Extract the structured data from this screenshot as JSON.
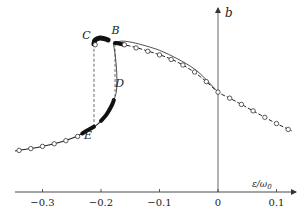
{
  "chart_data": {
    "type": "line",
    "title": "",
    "xlabel": "ε/ω₀",
    "xlabel_main": "ε/ω",
    "xlabel_sub": "0",
    "ylabel": "b",
    "xlim": [
      -0.35,
      0.135
    ],
    "ylim": [
      0,
      1
    ],
    "x_ticks": [
      -0.3,
      -0.2,
      -0.1,
      0,
      0.1
    ],
    "x_tick_labels": [
      "−0.3",
      "−0.2",
      "−0.1",
      "0",
      "0.1"
    ],
    "grid": false,
    "legend": "none",
    "series": [
      {
        "name": "lower-branch",
        "style": "solid",
        "points": [
          [
            -0.347,
            0.223
          ],
          [
            -0.32,
            0.236
          ],
          [
            -0.297,
            0.25
          ],
          [
            -0.275,
            0.266
          ],
          [
            -0.253,
            0.288
          ],
          [
            -0.237,
            0.31
          ],
          [
            -0.222,
            0.337
          ],
          [
            -0.21,
            0.358
          ],
          [
            -0.202,
            0.38
          ],
          [
            -0.194,
            0.405
          ],
          [
            -0.188,
            0.435
          ],
          [
            -0.182,
            0.468
          ],
          [
            -0.178,
            0.5
          ]
        ]
      },
      {
        "name": "unstable-branch",
        "style": "solid-thin",
        "points": [
          [
            -0.178,
            0.5
          ],
          [
            -0.174,
            0.54
          ],
          [
            -0.173,
            0.582
          ],
          [
            -0.173,
            0.64
          ],
          [
            -0.174,
            0.69
          ],
          [
            -0.176,
            0.75
          ],
          [
            -0.179,
            0.81
          ]
        ]
      },
      {
        "name": "upper-branch-C",
        "style": "thick",
        "points": [
          [
            -0.212,
            0.805
          ],
          [
            -0.21,
            0.826
          ],
          [
            -0.202,
            0.837
          ],
          [
            -0.193,
            0.832
          ],
          [
            -0.188,
            0.826
          ]
        ]
      },
      {
        "name": "upper-branch",
        "style": "dashed-circles",
        "points": [
          [
            -0.176,
            0.812
          ],
          [
            -0.16,
            0.8
          ],
          [
            -0.14,
            0.785
          ],
          [
            -0.12,
            0.766
          ],
          [
            -0.099,
            0.745
          ],
          [
            -0.08,
            0.722
          ],
          [
            -0.06,
            0.69
          ],
          [
            -0.04,
            0.65
          ],
          [
            -0.02,
            0.6
          ],
          [
            0,
            0.543
          ],
          [
            0.02,
            0.51
          ],
          [
            0.04,
            0.476
          ],
          [
            0.06,
            0.441
          ],
          [
            0.08,
            0.406
          ],
          [
            0.1,
            0.372
          ],
          [
            0.126,
            0.332
          ]
        ]
      },
      {
        "name": "upper-branch-thin",
        "style": "solid-thin",
        "points": [
          [
            -0.179,
            0.81
          ],
          [
            -0.165,
            0.82
          ],
          [
            -0.15,
            0.815
          ],
          [
            -0.13,
            0.8
          ],
          [
            -0.1,
            0.77
          ],
          [
            -0.07,
            0.725
          ],
          [
            -0.04,
            0.668
          ],
          [
            -0.02,
            0.61
          ],
          [
            0,
            0.543
          ]
        ]
      },
      {
        "name": "jump-C-E",
        "style": "dashed",
        "points": [
          [
            -0.212,
            0.805
          ],
          [
            -0.212,
            0.345
          ]
        ]
      },
      {
        "name": "jump-B-D",
        "style": "dashed",
        "points": [
          [
            -0.176,
            0.805
          ],
          [
            -0.176,
            0.52
          ]
        ]
      }
    ],
    "circle_markers": [
      [
        -0.34,
        0.226
      ],
      [
        -0.32,
        0.236
      ],
      [
        -0.3,
        0.248
      ],
      [
        -0.28,
        0.262
      ],
      [
        -0.26,
        0.279
      ],
      [
        -0.24,
        0.302
      ],
      [
        -0.16,
        0.8
      ],
      [
        -0.14,
        0.783
      ],
      [
        -0.12,
        0.765
      ],
      [
        -0.1,
        0.745
      ],
      [
        -0.08,
        0.72
      ],
      [
        -0.06,
        0.69
      ],
      [
        -0.04,
        0.652
      ],
      [
        -0.02,
        0.6
      ],
      [
        0,
        0.543
      ],
      [
        0.02,
        0.51
      ],
      [
        0.04,
        0.476
      ],
      [
        0.06,
        0.441
      ],
      [
        0.08,
        0.406
      ],
      [
        0.1,
        0.372
      ],
      [
        0.12,
        0.34
      ],
      [
        -0.21,
        0.8
      ]
    ],
    "thick_segments": [
      {
        "name": "segment-E",
        "points": [
          [
            -0.232,
            0.318
          ],
          [
            -0.222,
            0.337
          ],
          [
            -0.212,
            0.355
          ]
        ]
      },
      {
        "name": "segment-D",
        "points": [
          [
            -0.2,
            0.387
          ],
          [
            -0.192,
            0.415
          ],
          [
            -0.186,
            0.445
          ],
          [
            -0.181,
            0.475
          ],
          [
            -0.178,
            0.5
          ]
        ]
      },
      {
        "name": "segment-B",
        "points": [
          [
            -0.176,
            0.81
          ],
          [
            -0.168,
            0.806
          ],
          [
            -0.16,
            0.8
          ]
        ]
      }
    ],
    "annotations": [
      {
        "text": "C",
        "x": -0.225,
        "y": 0.83
      },
      {
        "text": "B",
        "x": -0.175,
        "y": 0.86
      },
      {
        "text": "D",
        "x": -0.168,
        "y": 0.57
      },
      {
        "text": "E",
        "x": -0.222,
        "y": 0.29
      }
    ]
  }
}
